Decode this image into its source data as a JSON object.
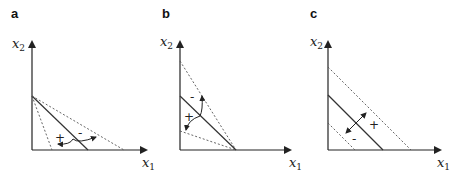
{
  "figure": {
    "panels": [
      {
        "id": "a",
        "label": "a",
        "x_axis_label": "x",
        "x_axis_sub": "1",
        "y_axis_label": "x",
        "y_axis_sub": "2",
        "plus_sign": "+",
        "minus_sign": "-",
        "description": "Lines pivoting about a common intercept on x2 axis; rotation arrow"
      },
      {
        "id": "b",
        "label": "b",
        "x_axis_label": "x",
        "x_axis_sub": "1",
        "y_axis_label": "x",
        "y_axis_sub": "2",
        "plus_sign": "+",
        "minus_sign": "-",
        "description": "Lines pivoting about a common intercept on x1 axis; rotation arrow"
      },
      {
        "id": "c",
        "label": "c",
        "x_axis_label": "x",
        "x_axis_sub": "1",
        "y_axis_label": "x",
        "y_axis_sub": "2",
        "plus_sign": "+",
        "minus_sign": "-",
        "description": "Parallel shift of line; double-headed arrow"
      }
    ],
    "colors": {
      "axis": "#222222",
      "solid_line": "#333333",
      "dotted_line": "#555555"
    }
  }
}
